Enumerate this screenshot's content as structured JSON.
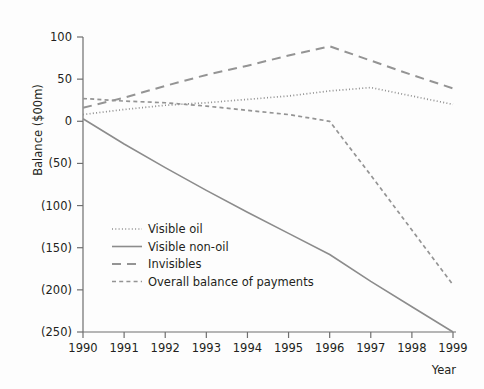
{
  "chart_data": {
    "type": "line",
    "title": "",
    "xlabel": "Year",
    "ylabel": "Balance ($00m)",
    "x": [
      1990,
      1991,
      1992,
      1993,
      1994,
      1995,
      1996,
      1997,
      1998,
      1999
    ],
    "xtick_labels": [
      "1990",
      "1991",
      "1992",
      "1993",
      "1994",
      "1995",
      "1996",
      "1997",
      "1998",
      "1999"
    ],
    "xlim": [
      1990,
      1999
    ],
    "ylim": [
      -250,
      100
    ],
    "yticks": [
      100,
      50,
      0,
      -50,
      -100,
      -150,
      -200,
      -250
    ],
    "ytick_labels": [
      "100",
      "50",
      "0",
      "(50)",
      "(100)",
      "(150)",
      "(200)",
      "(250)"
    ],
    "grid": false,
    "legend_position": "center-left",
    "series": [
      {
        "name": "Visible oil",
        "style": "dotted",
        "color": "#8f8f8f",
        "values": [
          8,
          14,
          19,
          22,
          26,
          30,
          36,
          40,
          30,
          20
        ]
      },
      {
        "name": "Visible non-oil",
        "style": "solid",
        "color": "#8c8c8c",
        "values": [
          3,
          -27,
          -55,
          -82,
          -108,
          -133,
          -158,
          -190,
          -220,
          -250
        ]
      },
      {
        "name": "Invisibles",
        "style": "dashed-long",
        "color": "#949494",
        "values": [
          16,
          28,
          42,
          55,
          66,
          78,
          89,
          72,
          55,
          39
        ]
      },
      {
        "name": "Overall balance of payments",
        "style": "dashed-short",
        "color": "#949494",
        "values": [
          27,
          24,
          22,
          18,
          13,
          8,
          0,
          -64,
          -129,
          -194
        ]
      }
    ]
  },
  "axis": {
    "y_title": "Balance ($00m)",
    "x_title": "Year"
  },
  "legend": {
    "items": [
      {
        "label": "Visible oil",
        "swatch": "dotted-line-icon"
      },
      {
        "label": "Visible non-oil",
        "swatch": "solid-line-icon"
      },
      {
        "label": "Invisibles",
        "swatch": "long-dash-line-icon"
      },
      {
        "label": "Overall balance of payments",
        "swatch": "short-dash-line-icon"
      }
    ]
  }
}
